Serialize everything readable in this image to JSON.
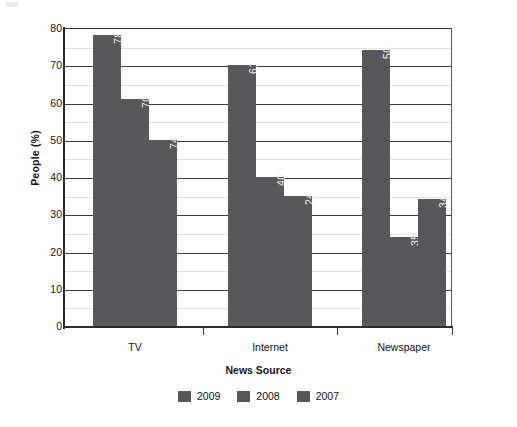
{
  "chart_data": {
    "type": "bar",
    "title": "",
    "xlabel": "News Source",
    "ylabel": "People (%)",
    "categories": [
      "TV",
      "Internet",
      "Newspaper"
    ],
    "series": [
      {
        "name": "2009",
        "values": [
          78,
          70,
          74
        ]
      },
      {
        "name": "2008",
        "values": [
          61,
          40,
          24
        ]
      },
      {
        "name": "2007",
        "values": [
          50,
          35,
          34
        ]
      }
    ],
    "series_by_category": {
      "TV": {
        "2009": 78,
        "2008": 70,
        "2007": 74
      },
      "Internet": {
        "2009": 61,
        "2008": 40,
        "2007": 24
      },
      "Newspaper": {
        "2009": 50,
        "2008": 35,
        "2007": 34
      }
    },
    "ylim": [
      0,
      80
    ],
    "ytick_labels": [
      "0",
      "10",
      "20",
      "30",
      "40",
      "50",
      "60",
      "70",
      "80"
    ],
    "ytick_values": [
      0,
      10,
      20,
      30,
      40,
      50,
      60,
      70,
      80
    ],
    "minor_tick_step": 5,
    "grid": "horizontal",
    "legend_position": "bottom",
    "bar_color": "#58585a",
    "bar_label_color": "#f2f2f2",
    "axis_color": "#2b2b2b",
    "grid_major_color": "#3d3d3d",
    "grid_minor_color": "#e2e2e2",
    "value_labels_rotated": true,
    "data_labels": {
      "TV": [
        "78",
        "70",
        "74"
      ],
      "Internet": [
        "61",
        "40",
        "24"
      ],
      "Newspaper": [
        "50",
        "35",
        "34"
      ]
    }
  },
  "axes": {
    "y_title": "People (%)",
    "x_title": "News Source"
  },
  "legend": {
    "items": [
      {
        "label": "2009",
        "color": "#58585a"
      },
      {
        "label": "2008",
        "color": "#58585a"
      },
      {
        "label": "2007",
        "color": "#58585a"
      }
    ]
  }
}
